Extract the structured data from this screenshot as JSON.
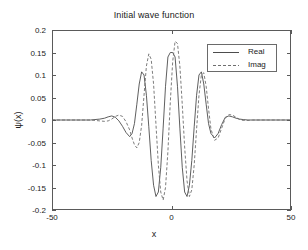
{
  "chart_data": {
    "type": "line",
    "title": "Initial wave function",
    "xlabel": "x",
    "ylabel": "ψ(x)",
    "xlim": [
      -50,
      50
    ],
    "ylim": [
      -0.2,
      0.2
    ],
    "xticks": [
      -50,
      0,
      50
    ],
    "xticklabels": [
      "-50",
      "0",
      "50"
    ],
    "yticks": [
      -0.2,
      -0.15,
      -0.1,
      -0.05,
      0,
      0.05,
      0.1,
      0.15,
      0.2
    ],
    "yticklabels": [
      "-0.2",
      "-0.15",
      "-0.1",
      "-0.05",
      "0",
      "0.05",
      "0.1",
      "0.15",
      "0.2"
    ],
    "grid": false,
    "legend_position": "upper right",
    "series": [
      {
        "name": "Real",
        "style": "solid",
        "color": "#4d4d4d",
        "x": [
          -50,
          -40,
          -34,
          -32,
          -30,
          -28,
          -26.5,
          -25,
          -23.5,
          -22,
          -20.5,
          -19,
          -17.5,
          -16.5,
          -15.5,
          -14.5,
          -13.5,
          -12.5,
          -11.5,
          -10.5,
          -9.5,
          -8.5,
          -7.5,
          -6.5,
          -5.5,
          -4.5,
          -3.5,
          -2.5,
          -1.5,
          -0.5,
          0.5,
          1.5,
          2.5,
          3.5,
          4.5,
          5.5,
          6.5,
          7.5,
          8.5,
          9.5,
          10.5,
          11.5,
          12.5,
          13.5,
          14.5,
          15.5,
          16.5,
          18,
          19.5,
          21,
          22.5,
          24,
          25.5,
          27,
          28.5,
          30,
          32,
          34,
          40,
          50
        ],
        "y": [
          0,
          0,
          0,
          0.001,
          0.002,
          0.004,
          0.007,
          0.009,
          0.006,
          -0.002,
          -0.014,
          -0.028,
          -0.037,
          -0.03,
          -0.008,
          0.035,
          0.08,
          0.107,
          0.1,
          0.055,
          -0.015,
          -0.09,
          -0.145,
          -0.17,
          -0.16,
          -0.105,
          -0.018,
          0.075,
          0.14,
          0.15,
          0.15,
          0.14,
          0.075,
          -0.018,
          -0.105,
          -0.16,
          -0.17,
          -0.145,
          -0.09,
          -0.015,
          0.055,
          0.1,
          0.107,
          0.08,
          0.035,
          -0.008,
          -0.03,
          -0.04,
          -0.03,
          -0.01,
          0.006,
          0.009,
          0.007,
          0.004,
          0.002,
          0.001,
          0,
          0,
          0,
          0
        ]
      },
      {
        "name": "Imag",
        "style": "dashed",
        "color": "#6e6e6e",
        "x": [
          -50,
          -40,
          -34,
          -32,
          -30,
          -28,
          -26.5,
          -25,
          -23.5,
          -22,
          -20.5,
          -19,
          -17.5,
          -16.5,
          -15.5,
          -14.5,
          -13.5,
          -12.5,
          -11.5,
          -10.5,
          -9.5,
          -8.5,
          -7.5,
          -6.5,
          -5.5,
          -4.5,
          -3.5,
          -2.5,
          -1.5,
          -0.5,
          0.5,
          1.5,
          2.5,
          3.5,
          4.5,
          5.5,
          6.5,
          7.5,
          8.5,
          9.5,
          10.5,
          11.5,
          12.5,
          13.5,
          14.5,
          15.5,
          16.5,
          18,
          19.5,
          21,
          22.5,
          24,
          25.5,
          27,
          28.5,
          30,
          32,
          34,
          40,
          50
        ],
        "y": [
          0,
          0,
          0,
          -0.001,
          -0.002,
          -0.003,
          -0.002,
          0.002,
          0.008,
          0.011,
          0.008,
          -0.004,
          -0.022,
          -0.04,
          -0.055,
          -0.062,
          -0.05,
          -0.012,
          0.055,
          0.12,
          0.147,
          0.135,
          0.08,
          -0.01,
          -0.1,
          -0.16,
          -0.178,
          -0.15,
          -0.07,
          0.04,
          0.13,
          0.175,
          0.17,
          0.12,
          0.035,
          -0.06,
          -0.135,
          -0.17,
          -0.155,
          -0.1,
          -0.02,
          0.055,
          0.1,
          0.105,
          0.075,
          0.025,
          -0.02,
          -0.045,
          -0.04,
          -0.018,
          0.004,
          0.012,
          0.011,
          0.006,
          0.001,
          -0.001,
          -0.001,
          0,
          0,
          0
        ]
      }
    ]
  },
  "legend": {
    "entries": [
      {
        "label": "Real",
        "style": "solid"
      },
      {
        "label": "Imag",
        "style": "dashed"
      }
    ]
  },
  "colors": {
    "axis": "#5a5a5a",
    "text": "#1a1a1a",
    "background": "#ffffff",
    "real_line": "#4d4d4d",
    "imag_line": "#6e6e6e"
  }
}
